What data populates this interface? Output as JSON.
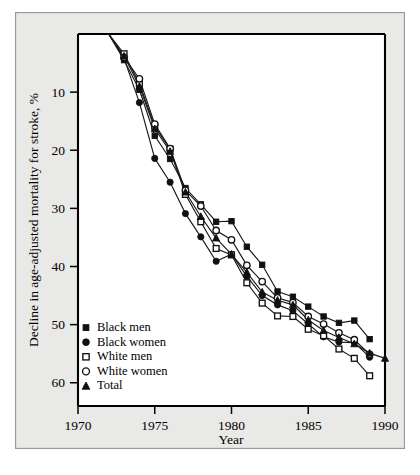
{
  "figure": {
    "background_color": "#e9e9e7",
    "plot_background_color": "#ffffff",
    "axis_color": "#000000",
    "series_color": "#111111"
  },
  "caption": {
    "text": ""
  },
  "chart_data": {
    "type": "line",
    "title": "",
    "subtitle": "",
    "xlabel": "Year",
    "ylabel": "Decline in age-adjusted mortality for stroke, %",
    "xlim": [
      1970,
      1990
    ],
    "ylim": [
      0,
      64
    ],
    "y_axis_inverted": true,
    "grid": false,
    "legend_position": "bottom-left",
    "xticks": [
      1970,
      1975,
      1980,
      1985,
      1990
    ],
    "xticklabels": [
      "1970",
      "1975",
      "1980",
      "1985",
      "1990"
    ],
    "yticks": [
      10,
      20,
      30,
      40,
      50,
      60
    ],
    "yticklabels": [
      "10",
      "20",
      "30",
      "40",
      "50",
      "60"
    ],
    "annotations": [],
    "series": [
      {
        "name": "Black men",
        "marker": "filled-square",
        "x": [
          1972,
          1973,
          1974,
          1975,
          1976,
          1977,
          1978,
          1979,
          1980,
          1981,
          1982,
          1983,
          1984,
          1985,
          1986,
          1987,
          1988,
          1989
        ],
        "values": [
          0.0,
          4.5,
          9.6,
          17.5,
          21.5,
          26.5,
          29.3,
          32.3,
          32.2,
          36.6,
          39.7,
          44.3,
          45.2,
          46.9,
          48.6,
          49.7,
          49.3,
          52.5
        ]
      },
      {
        "name": "Black women",
        "marker": "filled-circle",
        "x": [
          1972,
          1973,
          1974,
          1975,
          1976,
          1977,
          1978,
          1979,
          1980,
          1981,
          1982,
          1983,
          1984,
          1985,
          1986,
          1987,
          1988,
          1989
        ],
        "values": [
          0.0,
          4.2,
          11.8,
          21.4,
          25.5,
          30.9,
          34.9,
          39.1,
          37.9,
          41.7,
          45.0,
          46.6,
          47.6,
          49.9,
          52.1,
          53.0,
          53.1,
          55.6
        ]
      },
      {
        "name": "White men",
        "marker": "open-square",
        "x": [
          1972,
          1973,
          1974,
          1975,
          1976,
          1977,
          1978,
          1979,
          1980,
          1981,
          1982,
          1983,
          1984,
          1985,
          1986,
          1987,
          1988,
          1989
        ],
        "values": [
          0.0,
          3.4,
          8.5,
          15.9,
          19.8,
          27.6,
          32.3,
          36.9,
          38.0,
          42.8,
          46.3,
          48.5,
          48.6,
          50.8,
          51.9,
          54.2,
          55.8,
          58.8
        ]
      },
      {
        "name": "White women",
        "marker": "open-circle",
        "x": [
          1972,
          1973,
          1974,
          1975,
          1976,
          1977,
          1978,
          1979,
          1980,
          1981,
          1982,
          1983,
          1984,
          1985,
          1986,
          1987,
          1988,
          1989
        ],
        "values": [
          0.0,
          4.0,
          7.7,
          15.5,
          19.7,
          26.9,
          29.6,
          33.8,
          35.4,
          39.8,
          42.6,
          45.4,
          46.2,
          48.6,
          49.9,
          51.4,
          52.6,
          55.1
        ]
      },
      {
        "name": "Total",
        "marker": "filled-triangle",
        "x": [
          1972,
          1973,
          1974,
          1975,
          1976,
          1977,
          1978,
          1979,
          1980,
          1981,
          1982,
          1983,
          1984,
          1985,
          1986,
          1987,
          1988,
          1989,
          1990
        ],
        "values": [
          0.0,
          3.8,
          9.0,
          16.3,
          20.2,
          27.2,
          31.4,
          35.1,
          37.9,
          41.0,
          44.4,
          45.8,
          46.6,
          49.2,
          51.0,
          52.2,
          53.3,
          54.9,
          55.8
        ]
      }
    ],
    "legend": [
      {
        "label": "Black men",
        "marker": "filled-square"
      },
      {
        "label": "Black women",
        "marker": "filled-circle"
      },
      {
        "label": "White men",
        "marker": "open-square"
      },
      {
        "label": "White women",
        "marker": "open-circle"
      },
      {
        "label": "Total",
        "marker": "filled-triangle"
      }
    ]
  }
}
